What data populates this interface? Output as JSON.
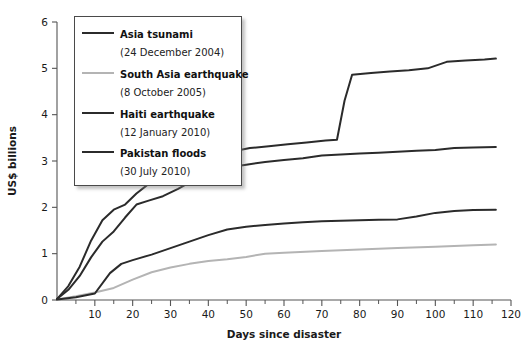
{
  "chart_data": {
    "type": "line",
    "title": "",
    "xlabel": "Days since disaster",
    "ylabel": "US$ billions",
    "xlim": [
      0,
      120
    ],
    "ylim": [
      0,
      6
    ],
    "xticks": [
      0,
      10,
      20,
      30,
      40,
      50,
      60,
      70,
      80,
      90,
      100,
      110,
      120
    ],
    "xtick_labels": [
      "0",
      "10",
      "20",
      "30",
      "40",
      "50",
      "60",
      "70",
      "80",
      "90",
      "100",
      "110",
      "120"
    ],
    "x_minor_step": 5,
    "yticks": [
      0,
      1,
      2,
      3,
      4,
      5,
      6
    ],
    "ytick_labels": [
      "0",
      "1",
      "2",
      "3",
      "4",
      "5",
      "6"
    ],
    "grid": false,
    "legend_position": "upper-left",
    "series": [
      {
        "name": "Asia tsunami",
        "date": "(24 December 2004)",
        "color": "#2b2b2b",
        "width": 2.0,
        "points": [
          [
            0,
            0.02
          ],
          [
            3,
            0.3
          ],
          [
            6,
            0.72
          ],
          [
            9,
            1.28
          ],
          [
            12,
            1.72
          ],
          [
            15,
            1.95
          ],
          [
            18,
            2.06
          ],
          [
            21,
            2.3
          ],
          [
            26,
            2.62
          ],
          [
            31,
            2.78
          ],
          [
            36,
            2.88
          ],
          [
            41,
            3.0
          ],
          [
            46,
            3.2
          ],
          [
            51,
            3.28
          ],
          [
            56,
            3.32
          ],
          [
            61,
            3.36
          ],
          [
            66,
            3.4
          ],
          [
            71,
            3.44
          ],
          [
            74,
            3.46
          ],
          [
            76,
            4.3
          ],
          [
            78,
            4.86
          ],
          [
            83,
            4.9
          ],
          [
            88,
            4.93
          ],
          [
            93,
            4.96
          ],
          [
            98,
            5.0
          ],
          [
            103,
            5.14
          ],
          [
            108,
            5.17
          ],
          [
            113,
            5.19
          ],
          [
            116,
            5.21
          ]
        ]
      },
      {
        "name": "South Asia earthquake",
        "date": "(8 October 2005)",
        "color": "#b4b4b4",
        "width": 2.0,
        "points": [
          [
            0,
            0.01
          ],
          [
            5,
            0.08
          ],
          [
            10,
            0.16
          ],
          [
            15,
            0.26
          ],
          [
            20,
            0.44
          ],
          [
            25,
            0.6
          ],
          [
            30,
            0.7
          ],
          [
            35,
            0.78
          ],
          [
            40,
            0.84
          ],
          [
            45,
            0.88
          ],
          [
            50,
            0.93
          ],
          [
            55,
            1.0
          ],
          [
            60,
            1.02
          ],
          [
            70,
            1.06
          ],
          [
            80,
            1.09
          ],
          [
            90,
            1.12
          ],
          [
            100,
            1.15
          ],
          [
            110,
            1.18
          ],
          [
            116,
            1.2
          ]
        ]
      },
      {
        "name": "Haiti earthquake",
        "date": "(12 January 2010)",
        "color": "#2b2b2b",
        "width": 2.0,
        "points": [
          [
            0,
            0.02
          ],
          [
            3,
            0.22
          ],
          [
            6,
            0.52
          ],
          [
            9,
            0.92
          ],
          [
            12,
            1.26
          ],
          [
            15,
            1.48
          ],
          [
            18,
            1.78
          ],
          [
            21,
            2.06
          ],
          [
            24,
            2.14
          ],
          [
            28,
            2.24
          ],
          [
            32,
            2.4
          ],
          [
            36,
            2.58
          ],
          [
            40,
            2.72
          ],
          [
            45,
            2.86
          ],
          [
            50,
            2.92
          ],
          [
            55,
            2.98
          ],
          [
            60,
            3.02
          ],
          [
            65,
            3.06
          ],
          [
            70,
            3.12
          ],
          [
            75,
            3.14
          ],
          [
            80,
            3.16
          ],
          [
            85,
            3.18
          ],
          [
            90,
            3.2
          ],
          [
            95,
            3.22
          ],
          [
            100,
            3.24
          ],
          [
            105,
            3.28
          ],
          [
            110,
            3.29
          ],
          [
            116,
            3.3
          ]
        ]
      },
      {
        "name": "Pakistan floods",
        "date": "(30 July 2010)",
        "color": "#2b2b2b",
        "width": 2.0,
        "points": [
          [
            0,
            0.01
          ],
          [
            5,
            0.06
          ],
          [
            10,
            0.14
          ],
          [
            14,
            0.58
          ],
          [
            17,
            0.78
          ],
          [
            20,
            0.86
          ],
          [
            25,
            0.98
          ],
          [
            30,
            1.12
          ],
          [
            35,
            1.26
          ],
          [
            40,
            1.4
          ],
          [
            45,
            1.52
          ],
          [
            50,
            1.58
          ],
          [
            55,
            1.62
          ],
          [
            60,
            1.65
          ],
          [
            65,
            1.68
          ],
          [
            70,
            1.7
          ],
          [
            75,
            1.71
          ],
          [
            80,
            1.72
          ],
          [
            85,
            1.73
          ],
          [
            90,
            1.74
          ],
          [
            95,
            1.8
          ],
          [
            100,
            1.88
          ],
          [
            105,
            1.92
          ],
          [
            110,
            1.94
          ],
          [
            116,
            1.95
          ]
        ]
      }
    ]
  }
}
